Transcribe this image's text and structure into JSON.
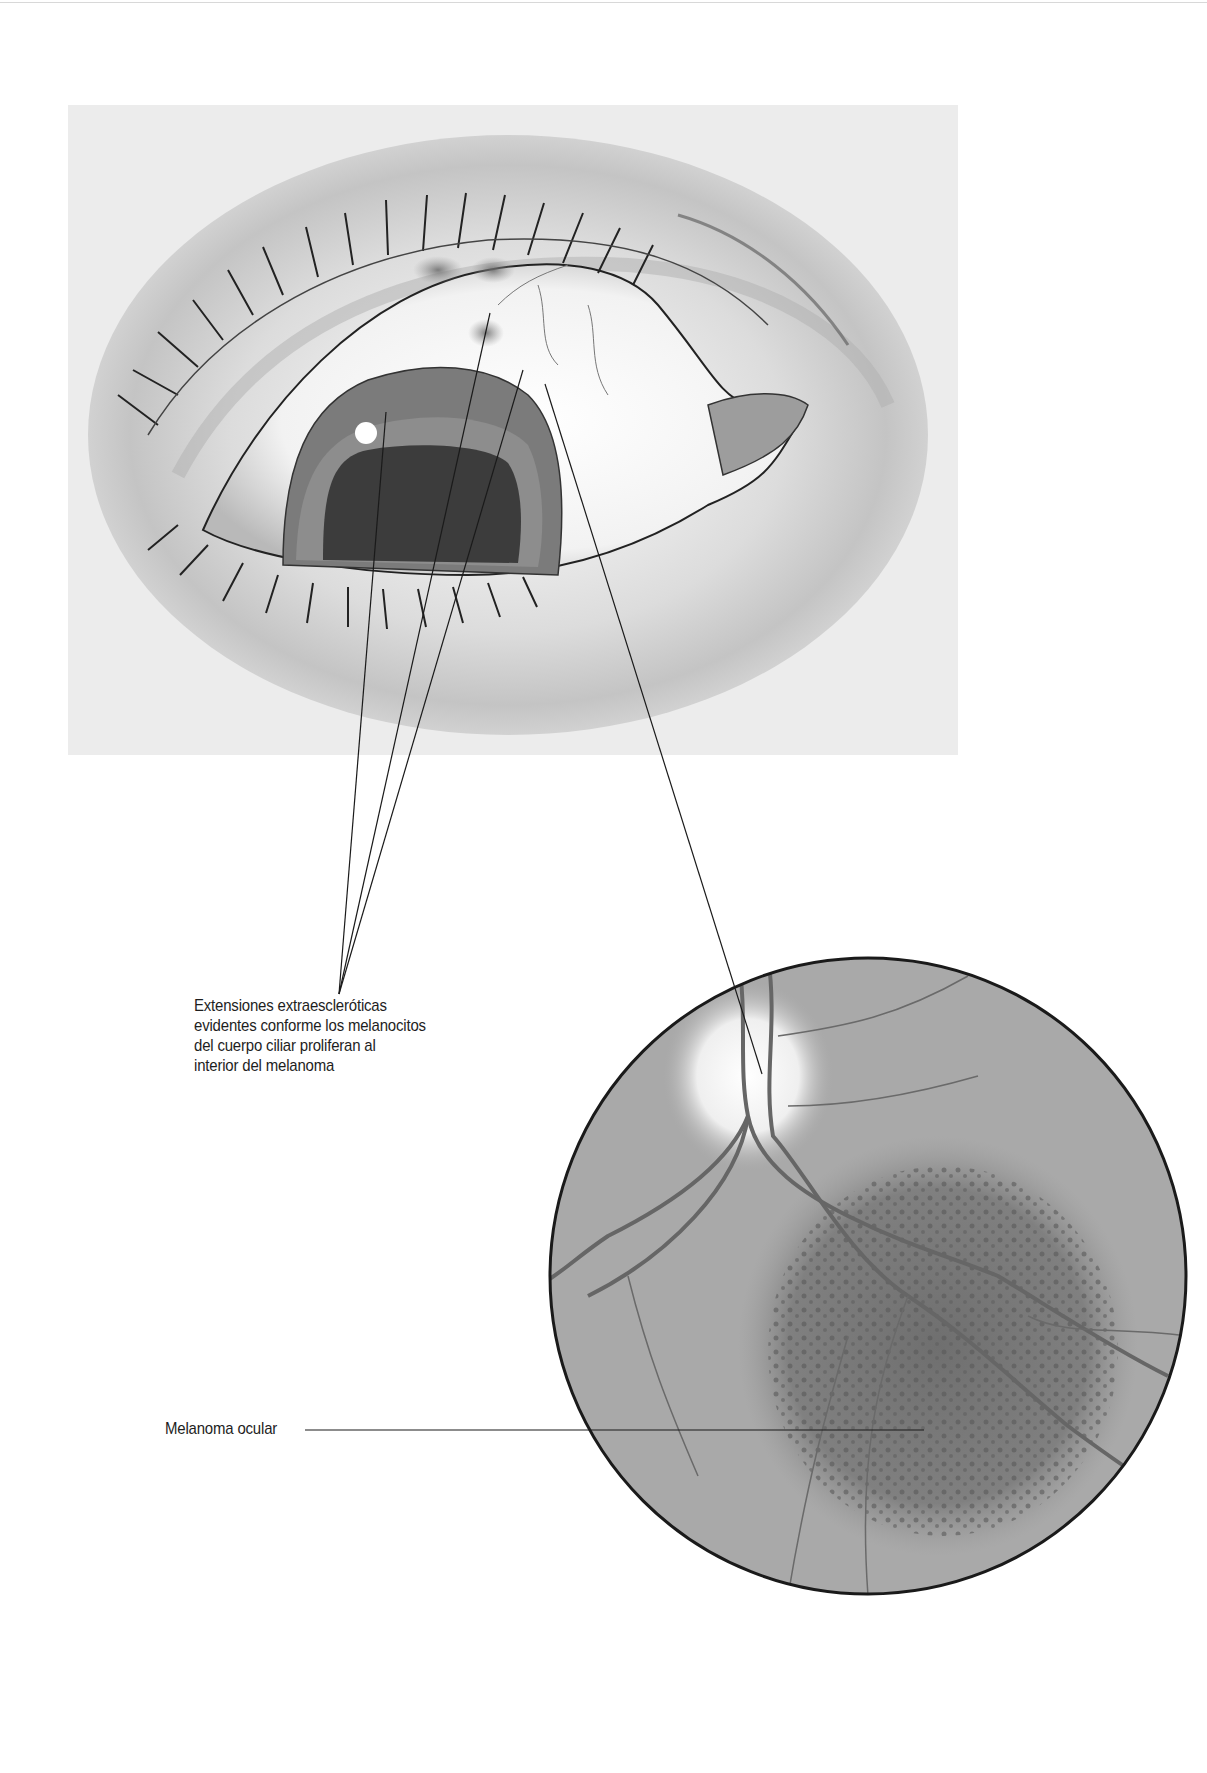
{
  "figure": {
    "panels": [
      {
        "id": "eye",
        "description": "Illustration of an eye with dark pigmented spots on the upper sclera"
      },
      {
        "id": "fundus",
        "description": "Circular fundus view showing optic disc, retinal vessels and a dark mottled melanoma"
      }
    ],
    "labels": {
      "extensions": "Extensiones extraescleróticas evidentes conforme los melanocitos del cuerpo ciliar proliferan al interior del melanoma",
      "extensions_lines": [
        "Extensiones extraescleróticas",
        "evidentes conforme los melanocitos",
        "del cuerpo ciliar proliferan al",
        "interior del melanoma"
      ],
      "melanoma": "Melanoma ocular"
    },
    "colors": {
      "background": "#ffffff",
      "panel": "#ececec",
      "leader_line": "#1a1a1a",
      "fundus_fill": "#a9a9a9",
      "tumor": "#6f6f6f"
    }
  }
}
